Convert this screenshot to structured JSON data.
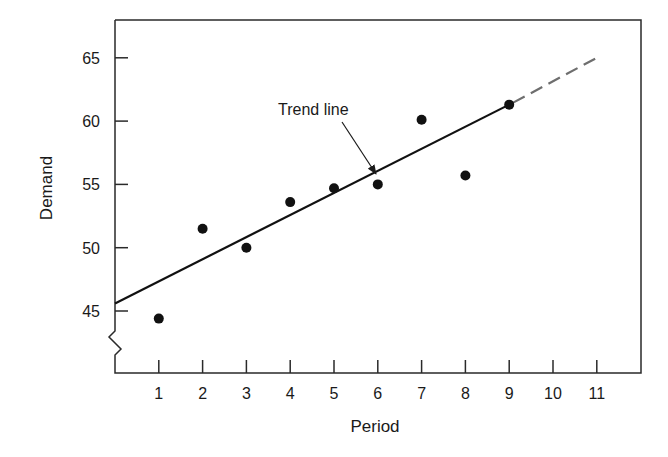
{
  "chart_data": {
    "type": "scatter",
    "title": "",
    "xlabel": "Period",
    "ylabel": "Demand",
    "xlim": [
      0,
      12
    ],
    "ylim": [
      41.8,
      68.3
    ],
    "x_ticks": [
      1,
      2,
      3,
      4,
      5,
      6,
      7,
      8,
      9,
      10,
      11
    ],
    "y_ticks": [
      45,
      50,
      55,
      60,
      65
    ],
    "grid": false,
    "axis_break": "y-axis below 45",
    "series": [
      {
        "name": "Demand",
        "kind": "points",
        "x": [
          1,
          2,
          3,
          4,
          5,
          6,
          7,
          8,
          9
        ],
        "values": [
          44.4,
          51.5,
          50.0,
          53.6,
          54.7,
          55.0,
          60.1,
          55.7,
          61.3
        ]
      },
      {
        "name": "Trend line",
        "kind": "line",
        "x": [
          0,
          9
        ],
        "values": [
          45.6,
          61.3
        ],
        "style": "solid"
      },
      {
        "name": "Trend line (forecast)",
        "kind": "line",
        "x": [
          9,
          11
        ],
        "values": [
          61.3,
          65.0
        ],
        "style": "dashed"
      }
    ],
    "annotations": [
      {
        "text": "Trend line",
        "arrow_to": [
          5.9,
          57.4
        ]
      }
    ],
    "legend": null
  },
  "labels": {
    "xlabel": "Period",
    "ylabel": "Demand",
    "annotation": "Trend line",
    "x_ticks": [
      "1",
      "2",
      "3",
      "4",
      "5",
      "6",
      "7",
      "8",
      "9",
      "10",
      "11"
    ],
    "y_ticks": [
      "45",
      "50",
      "55",
      "60",
      "65"
    ]
  },
  "colors": {
    "axis": "#2a2a2a",
    "points": "#111111",
    "trend_solid": "#111111",
    "trend_dashed": "#6e6e6e"
  }
}
